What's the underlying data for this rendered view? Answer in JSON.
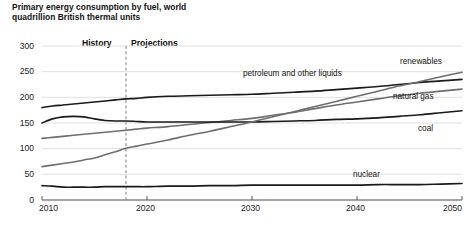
{
  "chart_data": {
    "type": "line",
    "title": "Primary energy consumption by fuel, world",
    "subtitle": "quadrillion British thermal units",
    "xlabel": "",
    "ylabel": "",
    "xlim": [
      2010,
      2050
    ],
    "ylim": [
      0,
      300
    ],
    "grid": true,
    "legend_position": "inline-right",
    "x_ticks": [
      "2010",
      "2020",
      "2030",
      "2040",
      "2050"
    ],
    "y_ticks": [
      "0",
      "50",
      "100",
      "150",
      "200",
      "250",
      "300"
    ],
    "annotations": {
      "history_label": "History",
      "projections_label": "Projections",
      "divider_year": 2018
    },
    "x": [
      2010,
      2011,
      2012,
      2013,
      2014,
      2015,
      2016,
      2017,
      2018,
      2019,
      2020,
      2022,
      2024,
      2026,
      2028,
      2030,
      2032,
      2034,
      2036,
      2038,
      2040,
      2042,
      2044,
      2046,
      2048,
      2050
    ],
    "series": [
      {
        "name": "petroleum and other liquids",
        "color": "#1a1a1a",
        "values": [
          180,
          183,
          185,
          187,
          189,
          191,
          193,
          195,
          197,
          198,
          200,
          202,
          203,
          204,
          205,
          206,
          208,
          210,
          212,
          215,
          218,
          221,
          225,
          229,
          232,
          235
        ]
      },
      {
        "name": "natural gas",
        "color": "#6e6e6e",
        "values": [
          120,
          122,
          124,
          126,
          128,
          130,
          132,
          134,
          136,
          138,
          140,
          143,
          147,
          151,
          155,
          159,
          165,
          171,
          178,
          185,
          191,
          197,
          203,
          208,
          212,
          216
        ]
      },
      {
        "name": "coal",
        "color": "#1a1a1a",
        "values": [
          150,
          158,
          162,
          163,
          162,
          158,
          155,
          154,
          154,
          153,
          152,
          152,
          152,
          152,
          152,
          152,
          153,
          154,
          155,
          157,
          158,
          160,
          163,
          166,
          170,
          174
        ]
      },
      {
        "name": "renewables",
        "color": "#6e6e6e",
        "values": [
          65,
          68,
          71,
          74,
          78,
          82,
          88,
          94,
          101,
          105,
          109,
          117,
          126,
          134,
          143,
          152,
          162,
          172,
          182,
          192,
          202,
          212,
          222,
          231,
          240,
          249
        ]
      },
      {
        "name": "nuclear",
        "color": "#1a1a1a",
        "values": [
          28,
          27,
          25,
          25,
          25,
          25,
          26,
          26,
          26,
          26,
          26,
          27,
          27,
          28,
          28,
          29,
          29,
          29,
          29,
          29,
          29,
          30,
          30,
          30,
          31,
          32
        ]
      }
    ],
    "series_labels": [
      {
        "text": "renewables",
        "x": 400,
        "y": 57
      },
      {
        "text": "petroleum and other liquids",
        "x": 243,
        "y": 69
      },
      {
        "text": "natural gas",
        "x": 393,
        "y": 92
      },
      {
        "text": "coal",
        "x": 418,
        "y": 124
      },
      {
        "text": "nuclear",
        "x": 353,
        "y": 170
      }
    ]
  }
}
